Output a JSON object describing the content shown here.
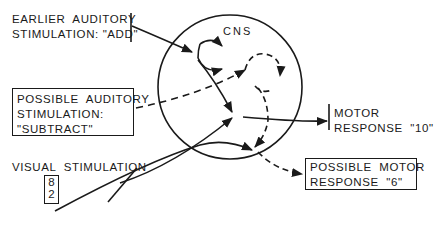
{
  "diagram": {
    "type": "flow-diagram",
    "central_node": {
      "label": "CNS"
    },
    "inputs": [
      {
        "id": "earlier-auditory",
        "lines": [
          "EARLIER  AUDITORY",
          "STIMULATION: \"ADD\""
        ],
        "style": "solid"
      },
      {
        "id": "possible-auditory",
        "lines": [
          "POSSIBLE  AUDITORY",
          "STIMULATION:",
          "\"SUBTRACT\""
        ],
        "style": "dashed",
        "boxed": true
      },
      {
        "id": "visual",
        "lines": [
          "VISUAL  STIMULATION"
        ],
        "style": "solid",
        "display": [
          "8",
          "2"
        ]
      }
    ],
    "outputs": [
      {
        "id": "motor-response",
        "lines": [
          "MOTOR",
          "RESPONSE  \"10\""
        ],
        "style": "solid"
      },
      {
        "id": "possible-motor",
        "lines": [
          "POSSIBLE  MOTOR",
          "RESPONSE  \"6\""
        ],
        "style": "dashed",
        "boxed": true
      }
    ],
    "colors": {
      "ink": "#1a1a1a",
      "background": "#ffffff"
    }
  }
}
